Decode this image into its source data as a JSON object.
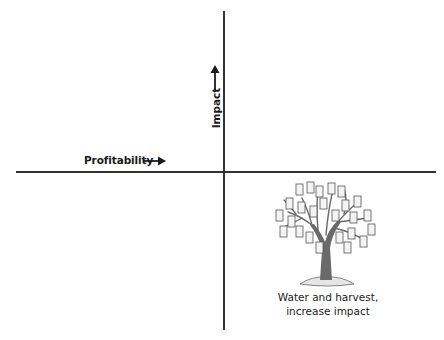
{
  "diagram": {
    "type": "quadrant",
    "x_axis": {
      "label": "Profitability",
      "direction": "right-arrow"
    },
    "y_axis": {
      "label": "Impact",
      "direction": "up-arrow"
    },
    "quadrants": [
      {
        "position": "bottom-right",
        "icon": "money-tree-icon",
        "caption_lines": [
          "Water and harvest,",
          "increase impact"
        ]
      }
    ]
  },
  "colors": {
    "axis": "#333333",
    "text": "#1a1a1a",
    "tree": "#555555"
  }
}
